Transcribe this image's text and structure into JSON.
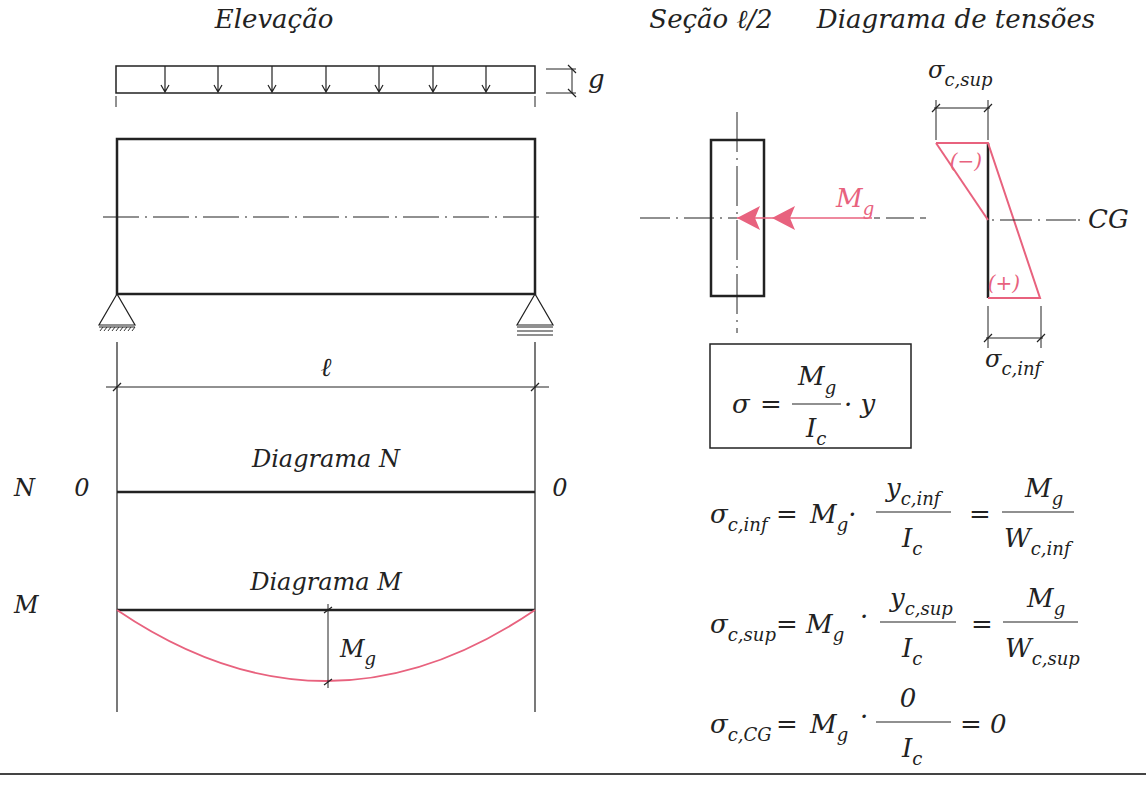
{
  "headers": {
    "elevation": "Elevação",
    "section": "Seção ℓ/2",
    "stress_diagram": "Diagrama de tensões"
  },
  "elevation": {
    "load_label": "g",
    "span_label": "ℓ",
    "load_arrow_count": 7
  },
  "diagram_n": {
    "row_label": "N",
    "title": "Diagrama N",
    "left_value": "0",
    "right_value": "0"
  },
  "diagram_m": {
    "row_label": "M",
    "title": "Diagrama M",
    "max_label_main": "M",
    "max_label_sub": "g"
  },
  "section": {
    "moment_main": "M",
    "moment_sub": "g"
  },
  "stress": {
    "top_label_main": "σ",
    "top_label_sub": "c,sup",
    "bottom_label_main": "σ",
    "bottom_label_sub": "c,inf",
    "compression_sign": "(−)",
    "tension_sign": "(+)",
    "cg_label": "CG"
  },
  "formulas": {
    "boxed": {
      "lhs": "σ",
      "eq": "=",
      "num_main": "M",
      "num_sub": "g",
      "den_main": "I",
      "den_sub": "c",
      "tail": "· y"
    },
    "inf": {
      "lhs_main": "σ",
      "lhs_sub": "c,inf",
      "mid_main": "M",
      "mid_sub": "g",
      "frac1_num_main": "y",
      "frac1_num_sub": "c,inf",
      "frac1_den_main": "I",
      "frac1_den_sub": "c",
      "frac2_num_main": "M",
      "frac2_num_sub": "g",
      "frac2_den_main": "W",
      "frac2_den_sub": "c,inf"
    },
    "sup": {
      "lhs_main": "σ",
      "lhs_sub": "c,sup",
      "mid_main": "M",
      "mid_sub": "g",
      "frac1_num_main": "y",
      "frac1_num_sub": "c,sup",
      "frac1_den_main": "I",
      "frac1_den_sub": "c",
      "frac2_num_main": "M",
      "frac2_num_sub": "g",
      "frac2_den_main": "W",
      "frac2_den_sub": "c,sup"
    },
    "cg": {
      "lhs_main": "σ",
      "lhs_sub": "c,CG",
      "mid_main": "M",
      "mid_sub": "g",
      "frac_num": "0",
      "frac_den_main": "I",
      "frac_den_sub": "c",
      "result": "= 0"
    }
  },
  "colors": {
    "accent": "#e8627e",
    "ink": "#222222"
  }
}
